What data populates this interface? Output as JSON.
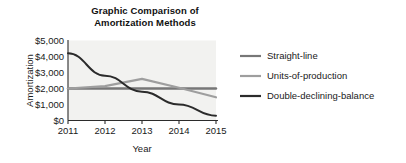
{
  "figure": {
    "title_line1": "Graphic Comparison of",
    "title_line2": "Amortization Methods",
    "background_color": "#ffffff",
    "plot_background_color": "#f2f2f0",
    "axis_color": "#2b2b2b"
  },
  "chart_data": {
    "type": "line",
    "title": "Graphic Comparison of Amortization Methods",
    "xlabel": "Year",
    "ylabel": "Amortization",
    "categories": [
      "2011",
      "2012",
      "2013",
      "2014",
      "2015"
    ],
    "x": [
      2011,
      2012,
      2013,
      2014,
      2015
    ],
    "xlim": [
      2011,
      2015
    ],
    "ylim": [
      0,
      5000
    ],
    "yticks": [
      0,
      1000,
      2000,
      3000,
      4000,
      5000
    ],
    "ytick_labels": [
      "$0",
      "$1,000",
      "$2,000",
      "$3,000",
      "$4,000",
      "$5,000"
    ],
    "xticks": [
      2011,
      2012,
      2013,
      2014,
      2015
    ],
    "xtick_labels": [
      "2011",
      "2012",
      "2013",
      "2014",
      "2015"
    ],
    "grid": false,
    "legend_position": "right",
    "series": [
      {
        "name": "Straight-line",
        "color": "#777777",
        "width": 2.4,
        "values": [
          2000,
          2000,
          2000,
          2000,
          2000
        ]
      },
      {
        "name": "Units-of-production",
        "color": "#9e9e9e",
        "width": 2.2,
        "values": [
          2000,
          2150,
          2600,
          2050,
          1450
        ]
      },
      {
        "name": "Double-declining-balance",
        "color": "#2b2b2b",
        "width": 2.0,
        "values": [
          4200,
          2800,
          1800,
          1000,
          300
        ]
      }
    ]
  },
  "legend": {
    "entries": [
      {
        "label": "Straight-line"
      },
      {
        "label": "Units-of-production"
      },
      {
        "label": "Double-declining-balance"
      }
    ]
  }
}
